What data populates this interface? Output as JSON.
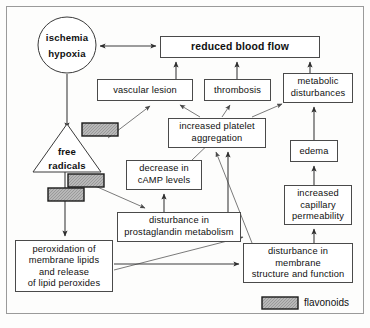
{
  "diagram": {
    "frame": {
      "x": 6,
      "y": 6,
      "width": 358,
      "height": 308
    },
    "nodes": [
      {
        "id": "ischemia",
        "shape": "ellipse",
        "label_lines": [
          "ischemia",
          "hypoxia"
        ],
        "cx": 67,
        "cy": 45,
        "rx": 29,
        "ry": 28,
        "bold": true
      },
      {
        "id": "reduced_blood_flow",
        "shape": "rect",
        "label_lines": [
          "reduced blood flow"
        ],
        "x": 160,
        "y": 36,
        "width": 160,
        "height": 22,
        "bold": true
      },
      {
        "id": "vascular_lesion",
        "shape": "rect",
        "label_lines": [
          "vascular lesion"
        ],
        "x": 97,
        "y": 79,
        "width": 96,
        "height": 22,
        "bold": false
      },
      {
        "id": "thrombosis",
        "shape": "rect",
        "label_lines": [
          "thrombosis"
        ],
        "x": 204,
        "y": 79,
        "width": 67,
        "height": 22,
        "bold": false
      },
      {
        "id": "metabolic_disturbances",
        "shape": "rect",
        "label_lines": [
          "metabolic",
          "disturbances"
        ],
        "x": 283,
        "y": 73,
        "width": 70,
        "height": 30,
        "bold": false
      },
      {
        "id": "free_radicals",
        "shape": "triangle",
        "label_lines": [
          "free",
          "radicals"
        ],
        "x": 33,
        "y": 124,
        "width": 68,
        "height": 48,
        "bold": true
      },
      {
        "id": "increased_platelet_aggregation",
        "shape": "rect",
        "label_lines": [
          "increased platelet",
          "aggregation"
        ],
        "x": 168,
        "y": 118,
        "width": 98,
        "height": 30,
        "bold": false
      },
      {
        "id": "edema",
        "shape": "rect",
        "label_lines": [
          "edema"
        ],
        "x": 290,
        "y": 140,
        "width": 48,
        "height": 22,
        "bold": false
      },
      {
        "id": "decrease_camp",
        "shape": "rect",
        "label_lines": [
          "decrease in",
          "cAMP levels"
        ],
        "x": 126,
        "y": 160,
        "width": 76,
        "height": 30,
        "bold": false
      },
      {
        "id": "increased_capillary_permeability",
        "shape": "rect",
        "label_lines": [
          "increased",
          "capillary",
          "permeability"
        ],
        "x": 284,
        "y": 185,
        "width": 68,
        "height": 40,
        "bold": false
      },
      {
        "id": "disturbance_prostaglandin",
        "shape": "rect",
        "label_lines": [
          "disturbance in",
          "prostaglandin metabolism"
        ],
        "x": 117,
        "y": 212,
        "width": 124,
        "height": 30,
        "bold": false
      },
      {
        "id": "peroxidation_lipids",
        "shape": "rect",
        "label_lines": [
          "peroxidation of",
          "membrane lipids",
          "and release",
          "of lipid peroxides"
        ],
        "x": 15,
        "y": 240,
        "width": 98,
        "height": 52,
        "bold": false
      },
      {
        "id": "disturbance_membrane",
        "shape": "rect",
        "label_lines": [
          "disturbance in",
          "membrane",
          "structure and function"
        ],
        "x": 243,
        "y": 243,
        "width": 110,
        "height": 40,
        "bold": false
      }
    ],
    "flavonoid_markers": [
      {
        "id": "marker-vascular-lesion",
        "x": 82,
        "y": 123,
        "width": 36,
        "height": 13
      },
      {
        "id": "marker-prostaglandin",
        "x": 68,
        "y": 174,
        "width": 36,
        "height": 13
      },
      {
        "id": "marker-peroxidation",
        "x": 48,
        "y": 188,
        "width": 36,
        "height": 13
      }
    ],
    "legend": {
      "swatch": {
        "x": 262,
        "y": 297,
        "width": 36,
        "height": 12
      },
      "label": "flavonoids"
    },
    "colors": {
      "marker_fill": "#b4b4b4",
      "marker_stroke": "#1a1a1a",
      "box_stroke": "#4a4a4a",
      "edge_stroke": "#3d3d3d",
      "background": "#fdfdfc",
      "text": "#101010"
    },
    "edges": [
      {
        "id": "ischemia-to-reduced",
        "from": "ischemia",
        "to": "reduced_blood_flow",
        "arrows": "both"
      },
      {
        "id": "ischemia-to-free-radicals",
        "from": "ischemia",
        "to": "free_radicals",
        "arrows": "to"
      },
      {
        "id": "vascular-lesion-to-reduced",
        "from": "vascular_lesion",
        "to": "reduced_blood_flow",
        "arrows": "to"
      },
      {
        "id": "thrombosis-to-reduced",
        "from": "thrombosis",
        "to": "reduced_blood_flow",
        "arrows": "to"
      },
      {
        "id": "metabolic-to-reduced",
        "from": "metabolic_disturbances",
        "to": "reduced_blood_flow",
        "arrows": "to"
      },
      {
        "id": "free-radicals-to-vascular-lesion",
        "from": "free_radicals",
        "to": "vascular_lesion",
        "arrows": "to"
      },
      {
        "id": "platelet-to-vascular-lesion",
        "from": "increased_platelet_aggregation",
        "to": "vascular_lesion",
        "arrows": "to"
      },
      {
        "id": "platelet-to-thrombosis",
        "from": "increased_platelet_aggregation",
        "to": "thrombosis",
        "arrows": "to"
      },
      {
        "id": "platelet-to-metabolic",
        "from": "increased_platelet_aggregation",
        "to": "metabolic_disturbances",
        "arrows": "to"
      },
      {
        "id": "edema-to-metabolic",
        "from": "edema",
        "to": "metabolic_disturbances",
        "arrows": "to"
      },
      {
        "id": "capillary-to-edema",
        "from": "increased_capillary_permeability",
        "to": "edema",
        "arrows": "to"
      },
      {
        "id": "membrane-to-capillary",
        "from": "disturbance_membrane",
        "to": "increased_capillary_permeability",
        "arrows": "to"
      },
      {
        "id": "membrane-to-platelet",
        "from": "disturbance_membrane",
        "to": "increased_platelet_aggregation",
        "arrows": "to"
      },
      {
        "id": "camp-to-platelet",
        "from": "decrease_camp",
        "to": "increased_platelet_aggregation",
        "arrows": "to"
      },
      {
        "id": "prostaglandin-to-camp",
        "from": "disturbance_prostaglandin",
        "to": "decrease_camp",
        "arrows": "to"
      },
      {
        "id": "prostaglandin-to-platelet",
        "from": "disturbance_prostaglandin",
        "to": "increased_platelet_aggregation",
        "arrows": "to"
      },
      {
        "id": "free-radicals-to-prostaglandin",
        "from": "free_radicals",
        "to": "disturbance_prostaglandin",
        "arrows": "to"
      },
      {
        "id": "free-radicals-to-peroxidation",
        "from": "free_radicals",
        "to": "peroxidation_lipids",
        "arrows": "to"
      },
      {
        "id": "peroxidation-to-prostaglandin",
        "from": "peroxidation_lipids",
        "to": "disturbance_prostaglandin",
        "arrows": "to"
      },
      {
        "id": "peroxidation-to-membrane",
        "from": "peroxidation_lipids",
        "to": "disturbance_membrane",
        "arrows": "to"
      }
    ]
  }
}
